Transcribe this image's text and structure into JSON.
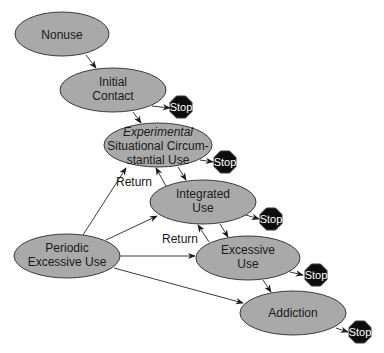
{
  "diagram": {
    "nodes": {
      "nonuse": {
        "line1": "Nonuse"
      },
      "initial": {
        "line1": "Initial",
        "line2": "Contact"
      },
      "experimental": {
        "line1": "Experimental",
        "line2": "Situational Circum-",
        "line3": "stantial Use"
      },
      "integrated": {
        "line1": "Integrated",
        "line2": "Use"
      },
      "periodic": {
        "line1": "Periodic",
        "line2": "Excessive Use"
      },
      "excessive": {
        "line1": "Excessive",
        "line2": "Use"
      },
      "addiction": {
        "line1": "Addiction"
      }
    },
    "stop_label": "Stop",
    "edge_labels": {
      "return1": "Return",
      "return2": "Return"
    },
    "colors": {
      "node_fill": "#a9a9a9",
      "node_stroke": "#3a3a3a",
      "stop_fill": "#0d0d0d",
      "stop_text": "#ffffff",
      "edge": "#3a3a3a"
    }
  }
}
